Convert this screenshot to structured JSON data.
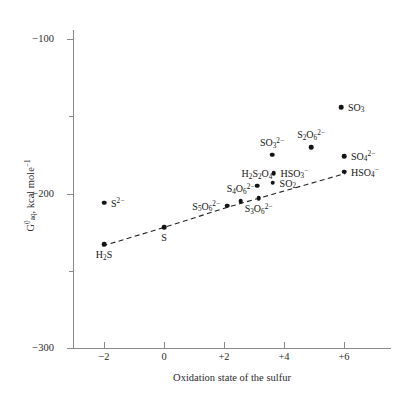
{
  "chart_data": {
    "type": "scatter",
    "title": "",
    "xlabel": "Oxidation state of the sulfur",
    "ylabel": "G°aq, kcal mole⁻¹",
    "ylabel_parts": {
      "main": "G",
      "sup": "0",
      "sub": "aq",
      "rest": ", kcal mole"
    },
    "xlim": [
      -3,
      7.5
    ],
    "ylim": [
      -300,
      -90
    ],
    "grid": false,
    "legend": "none",
    "xticks": [
      -2,
      0,
      2,
      4,
      6
    ],
    "xticklabels": [
      "−2",
      "0",
      "+2",
      "+4",
      "+6"
    ],
    "yticks": [
      -100,
      -200,
      -300
    ],
    "yticklabels": [
      "−100",
      "−200",
      "−300"
    ],
    "yminorticks": [
      -150,
      -250
    ],
    "points": [
      {
        "id": "H2S",
        "label_html": "H<sub>2</sub>S",
        "x": -2,
        "y": -233,
        "pos": "b"
      },
      {
        "id": "S2-",
        "label_html": "S<sup>2−</sup>",
        "x": -2,
        "y": -206,
        "pos": "r"
      },
      {
        "id": "S",
        "label_html": "S",
        "x": 0,
        "y": -222,
        "pos": "b"
      },
      {
        "id": "S5O6",
        "label_html": "S<sub>5</sub>O<sub>6</sub><sup>2−</sup>",
        "x": 2.1,
        "y": -208,
        "pos": "l"
      },
      {
        "id": "S4O6",
        "label_html": "S<sub>4</sub>O<sub>6</sub><sup>2−</sup>",
        "x": 2.55,
        "y": -205,
        "pos": "t"
      },
      {
        "id": "H2S2O4",
        "label_html": "H<sub>2</sub>S<sub>2</sub>O<sub>4</sub>",
        "x": 3.1,
        "y": -195,
        "pos": "t"
      },
      {
        "id": "S3O6",
        "label_html": "S<sub>3</sub>O<sub>6</sub><sup>2−</sup>",
        "x": 3.15,
        "y": -203,
        "pos": "b"
      },
      {
        "id": "SO32-",
        "label_html": "SO<sub>3</sub><sup>2−</sup>",
        "x": 3.6,
        "y": -175,
        "pos": "t"
      },
      {
        "id": "HSO3-",
        "label_html": "HSO<sub>3</sub><sup>−</sup>",
        "x": 3.65,
        "y": -187,
        "pos": "r"
      },
      {
        "id": "SO2",
        "label_html": "SO<sub>2</sub>",
        "x": 3.62,
        "y": -193,
        "pos": "r"
      },
      {
        "id": "S2O6",
        "label_html": "S<sub>2</sub>O<sub>6</sub><sup>2−</sup>",
        "x": 4.9,
        "y": -170,
        "pos": "t"
      },
      {
        "id": "SO3",
        "label_html": "SO<sub>3</sub>",
        "x": 5.9,
        "y": -144,
        "pos": "r"
      },
      {
        "id": "SO42-",
        "label_html": "SO<sub>4</sub><sup>2−</sup>",
        "x": 6.0,
        "y": -176,
        "pos": "r"
      },
      {
        "id": "HSO4-",
        "label_html": "HSO<sub>4</sub><sup>−</sup>",
        "x": 6.0,
        "y": -186,
        "pos": "r"
      }
    ],
    "trendline": {
      "style": "dashed",
      "color": "#222222",
      "points": [
        {
          "x": -2.05,
          "y": -234
        },
        {
          "x": 0.0,
          "y": -222
        },
        {
          "x": 2.1,
          "y": -209
        },
        {
          "x": 6.05,
          "y": -187
        }
      ]
    }
  },
  "colors": {
    "axis": "#8a8a8a",
    "marker": "#141414",
    "text": "#2b2b2b",
    "background": "#ffffff"
  }
}
